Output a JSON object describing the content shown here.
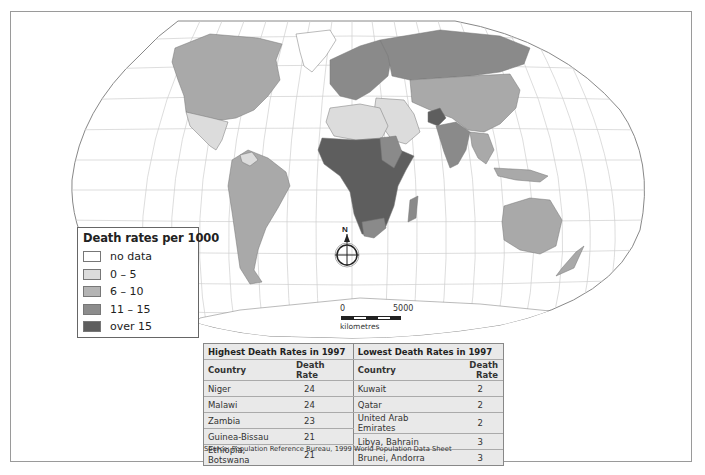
{
  "map": {
    "projection": "Robinson-style world projection",
    "shading_colors": {
      "no_data": "#ffffff",
      "0_5": "#dcdcdc",
      "6_10": "#a9a9a9",
      "11_15": "#8a8a8a",
      "over_15": "#5e5e5e",
      "graticule": "#c8c8c8",
      "outline": "#888888"
    },
    "compass_label": "N"
  },
  "legend": {
    "title": "Death rates per 1000",
    "items": [
      {
        "label": "no data",
        "color": "#ffffff"
      },
      {
        "label": "0 – 5",
        "color": "#dcdcdc"
      },
      {
        "label": "6 – 10",
        "color": "#b4b4b4"
      },
      {
        "label": "11 – 15",
        "color": "#8c8c8c"
      },
      {
        "label": "over 15",
        "color": "#5e5e5e"
      }
    ]
  },
  "scale_bar": {
    "start": "0",
    "end": "5000",
    "unit": "kilometres"
  },
  "tables": {
    "highest": {
      "caption": "Highest Death Rates in 1997",
      "headers": [
        "Country",
        "Death Rate"
      ],
      "rows": [
        {
          "country": "Niger",
          "rate": "24"
        },
        {
          "country": "Malawi",
          "rate": "24"
        },
        {
          "country": "Zambia",
          "rate": "23"
        },
        {
          "country": "Guinea-Bissau",
          "rate": "21"
        },
        {
          "country": "Ethiopia, Botswana",
          "rate": "21"
        }
      ]
    },
    "lowest": {
      "caption": "Lowest Death Rates in 1997",
      "headers": [
        "Country",
        "Death Rate"
      ],
      "rows": [
        {
          "country": "Kuwait",
          "rate": "2"
        },
        {
          "country": "Qatar",
          "rate": "2"
        },
        {
          "country": "United Arab Emirates",
          "rate": "2"
        },
        {
          "country": "Libya, Bahrain",
          "rate": "3"
        },
        {
          "country": "Brunei, Andorra",
          "rate": "3"
        }
      ]
    }
  },
  "source": "Source: Population Reference Bureau, 1999 World Population Data Sheet"
}
